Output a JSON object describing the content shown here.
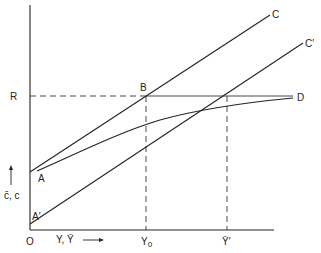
{
  "diagram": {
    "type": "economics-line-diagram",
    "axes": {
      "origin_label": "O",
      "x_label": "Y, Ȳ",
      "y_label": "c̄, c",
      "x_arrow": "right-arrow",
      "y_arrow": "up-arrow"
    },
    "lines": {
      "C": {
        "label": "C",
        "from": [
          30,
          172
        ],
        "to": [
          270,
          15
        ],
        "style": "solid"
      },
      "C_prime": {
        "label": "C′",
        "from": [
          30,
          224
        ],
        "to": [
          303,
          43
        ],
        "style": "solid"
      },
      "AD_curve": {
        "start_label": "A",
        "end_label": "D",
        "style": "solid"
      },
      "R_level": {
        "label": "R",
        "style": "dashed-then-solid"
      }
    },
    "points": {
      "A": "A",
      "A_prime": "A′",
      "B": "B",
      "D": "D",
      "R": "R"
    },
    "x_ticks": {
      "y0": "Y",
      "y0_sub": "0",
      "y_bar_prime": "Ȳ′"
    },
    "colors": {
      "line": "#222222",
      "background": "#ffffff"
    }
  }
}
